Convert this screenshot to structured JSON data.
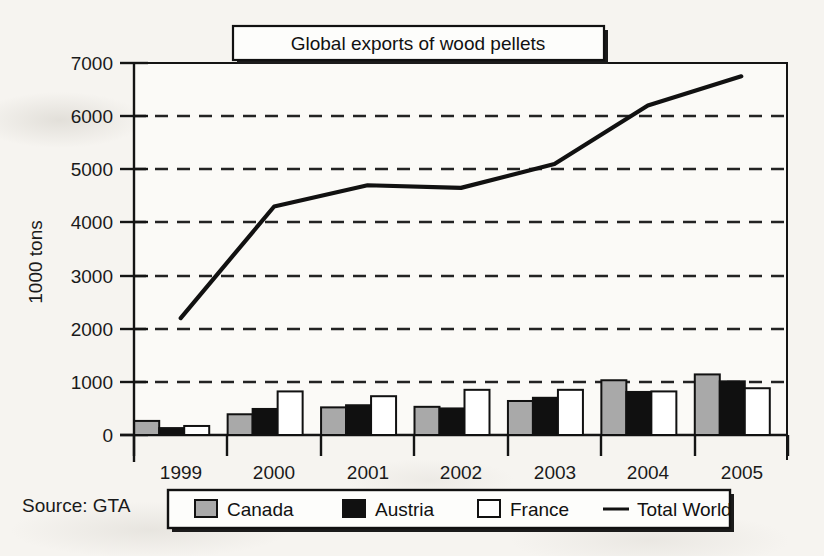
{
  "chart_data": {
    "type": "bar",
    "title": "Global exports of wood pellets",
    "xlabel": "",
    "ylabel": "1000 tons",
    "categories": [
      "1999",
      "2000",
      "2001",
      "2002",
      "2003",
      "2004",
      "2005"
    ],
    "ylim": [
      0,
      7000
    ],
    "ytick_step": 1000,
    "yticks": [
      "0",
      "1000",
      "2000",
      "3000",
      "4000",
      "5000",
      "6000",
      "7000"
    ],
    "grid": "horizontal-dashed",
    "legend_position": "below-axis",
    "series": [
      {
        "name": "Canada",
        "kind": "bar",
        "color": "#a9a9a9",
        "values": [
          265,
          390,
          520,
          530,
          640,
          1030,
          1140
        ]
      },
      {
        "name": "Austria",
        "kind": "bar",
        "color": "#101010",
        "values": [
          130,
          490,
          560,
          500,
          700,
          810,
          1010
        ]
      },
      {
        "name": "France",
        "kind": "bar",
        "color": "#ffffff",
        "values": [
          170,
          820,
          730,
          850,
          850,
          820,
          880
        ]
      },
      {
        "name": "Total World",
        "kind": "line",
        "color": "#111111",
        "values": [
          2200,
          4300,
          4700,
          4650,
          5100,
          6200,
          6750
        ]
      }
    ],
    "source": "Source: GTA"
  },
  "legend": {
    "items": [
      {
        "label": "Canada",
        "swatch": "filled-gray"
      },
      {
        "label": "Austria",
        "swatch": "filled-black"
      },
      {
        "label": "France",
        "swatch": "filled-white"
      },
      {
        "label": "Total World",
        "swatch": "line"
      }
    ]
  },
  "colors": {
    "canada": "#a9a9a9",
    "austria": "#101010",
    "france": "#ffffff",
    "total_world": "#111111",
    "axis": "#111111",
    "grid": "#222222",
    "paper": "#f6f4f0"
  }
}
